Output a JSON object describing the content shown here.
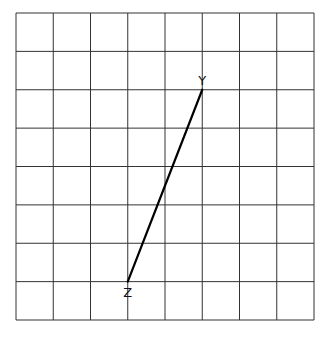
{
  "grid": {
    "columns": 8,
    "rows": 8,
    "left": 16,
    "top": 13,
    "right": 314,
    "bottom": 320,
    "line_color": "#333333"
  },
  "segment": {
    "color": "#000000",
    "start": {
      "label": "Y",
      "col": 5,
      "row": 2
    },
    "end": {
      "label": "Z",
      "col": 3,
      "row": 7
    }
  },
  "labels": {
    "Y": "Y",
    "Z": "Z"
  }
}
